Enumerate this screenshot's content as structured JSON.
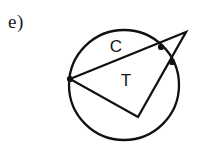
{
  "figure": {
    "item_label": "e)",
    "background_color": "#ffffff",
    "stroke_color": "#111111",
    "labels": {
      "circle_label": "C",
      "triangle_label": "T"
    },
    "geometry": {
      "circle": {
        "cx": 124,
        "cy": 85,
        "r": 55
      },
      "points": {
        "left_external": {
          "x": 70,
          "y": 79
        },
        "right_apex": {
          "x": 186,
          "y": 32
        },
        "bottom_internal": {
          "x": 138,
          "y": 117
        }
      },
      "intersection_dots": [
        {
          "x": 70,
          "y": 79
        },
        {
          "x": 161,
          "y": 47
        },
        {
          "x": 172,
          "y": 62
        }
      ],
      "label_positions": {
        "circle_label": {
          "x": 116,
          "y": 48
        },
        "triangle_label": {
          "x": 126,
          "y": 82
        }
      }
    }
  }
}
